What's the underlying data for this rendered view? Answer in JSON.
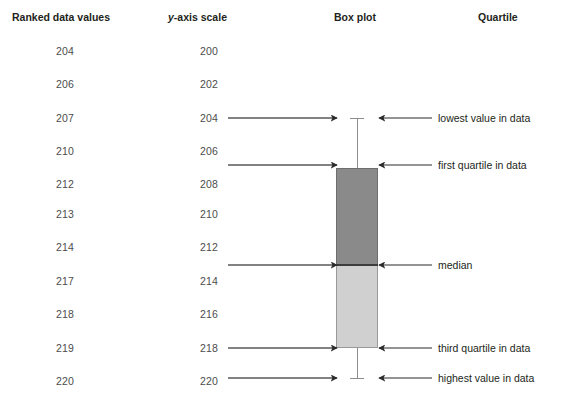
{
  "headers": {
    "ranked": "Ranked data values",
    "yaxis_pre": "y",
    "yaxis_post": "-axis scale",
    "boxplot": "Box plot",
    "quartile": "Quartile"
  },
  "ranked_values": [
    "204",
    "206",
    "207",
    "210",
    "212",
    "213",
    "214",
    "217",
    "218",
    "219",
    "220"
  ],
  "yaxis_values": [
    "200",
    "202",
    "204",
    "206",
    "208",
    "210",
    "212",
    "214",
    "216",
    "218",
    "220"
  ],
  "callouts": [
    "lowest value in data",
    "first quartile in data",
    "median",
    "third quartile in data",
    "highest value in data"
  ],
  "colors": {
    "upper_box": "#8a8a8a",
    "lower_box": "#d0d0d0",
    "median_line": "#3c3c3c",
    "whisker": "#8d8d8d",
    "arrow": "#2b2b2b",
    "scale_rule": "#58585a",
    "text": "#4c4c4c",
    "header_text": "#231f20"
  },
  "chart_data": {
    "type": "box",
    "title": "Box plot",
    "ylabel": "y-axis scale",
    "ylim": [
      200,
      220
    ],
    "yticks": [
      200,
      202,
      204,
      206,
      208,
      210,
      212,
      214,
      216,
      218,
      220
    ],
    "grid": false,
    "data": [
      204,
      206,
      207,
      210,
      212,
      213,
      214,
      217,
      218,
      219,
      220
    ],
    "five_number_summary": {
      "minimum": 204,
      "first_quartile": 207,
      "median": 213,
      "third_quartile": 218,
      "maximum": 220
    },
    "annotations": [
      {
        "value": 204,
        "label": "lowest value in data"
      },
      {
        "value": 207,
        "label": "first quartile in data"
      },
      {
        "value": 213,
        "label": "median"
      },
      {
        "value": 218,
        "label": "third quartile in data"
      },
      {
        "value": 220,
        "label": "highest value in data"
      }
    ]
  },
  "geometry": {
    "box_left": 336,
    "box_right": 378,
    "box_top_y": 168,
    "median_y": 265,
    "box_bottom_y": 348,
    "whisker_top_y": 118,
    "whisker_bottom_y": 378,
    "center_x": 357,
    "left_arrow_x_start": 228,
    "left_arrow_x_end": 337,
    "right_arrow_x_start": 432,
    "right_arrow_x_end": 378,
    "callout_text_x": 438,
    "row_y": [
      51,
      84,
      118,
      151,
      184,
      214,
      247,
      281,
      314,
      348,
      381
    ],
    "marker_y": [
      118,
      165,
      265,
      348,
      378
    ]
  }
}
